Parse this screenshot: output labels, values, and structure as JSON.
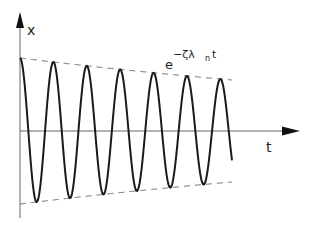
{
  "diagram": {
    "y_axis_label": "x",
    "x_axis_label": "t",
    "envelope_label": {
      "base": "e",
      "exponent": "−ζλ",
      "subscript": "n",
      "suffix": "t"
    },
    "colors": {
      "curve": "#1a1a1a",
      "axis": "#555555",
      "envelope": "#666666"
    },
    "geometry": {
      "origin_x": 20,
      "axis_y": 131,
      "x_end": 300,
      "y_top": 12,
      "y_bottom": 218,
      "amplitude0": 73,
      "period": 33.4,
      "t_end": 232,
      "decay": 0.00165
    }
  }
}
